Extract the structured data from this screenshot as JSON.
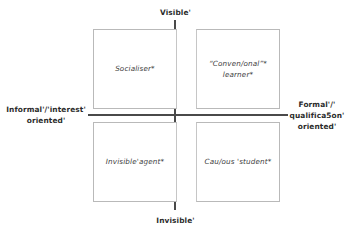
{
  "figure": {
    "type": "2x2-quadrant-matrix",
    "background_color": "#ffffff",
    "axis_color": "#4a4a4a",
    "box_border_color": "#b9b9b9",
    "text_color": "#2b2b2b"
  },
  "axes": {
    "vertical": {
      "top_label": "Visible'",
      "bottom_label": "Invisible'"
    },
    "horizontal": {
      "left_label": "Informal'/'interest'\noriented'",
      "right_label": "Formal'/'\nqualifica5on'\noriented'"
    }
  },
  "quadrants": [
    {
      "position": "top-left",
      "label": "Socialiser*",
      "x_axis": "Informal'/'interest' oriented'",
      "y_axis": "Visible'"
    },
    {
      "position": "top-right",
      "label": "“Conven/onal”*\nlearner*",
      "x_axis": "Formal'/'qualifica5on' oriented'",
      "y_axis": "Visible'"
    },
    {
      "position": "bottom-left",
      "label": "Invisible'agent*",
      "x_axis": "Informal'/'interest' oriented'",
      "y_axis": "Invisible'"
    },
    {
      "position": "bottom-right",
      "label": "Cau/ous 'student*",
      "x_axis": "Formal'/'qualifica5on' oriented'",
      "y_axis": "Invisible'"
    }
  ]
}
